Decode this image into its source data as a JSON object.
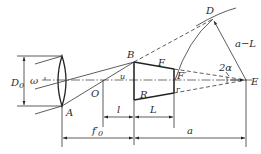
{
  "diagram": {
    "type": "optical-geometry",
    "labels": {
      "D0": "D",
      "D0_sub": "0",
      "omega": "ω",
      "A": "A",
      "O": "O",
      "u": "u",
      "B": "B",
      "R": "R",
      "F": "F",
      "F_prime": "F′",
      "r": "r",
      "D": "D",
      "a_minus_L": "a−L",
      "two_alpha": "2α",
      "E": "E",
      "l": "l",
      "L": "L",
      "f0_prime": "f′",
      "f0_prime_sub": "0",
      "a": "a"
    }
  }
}
